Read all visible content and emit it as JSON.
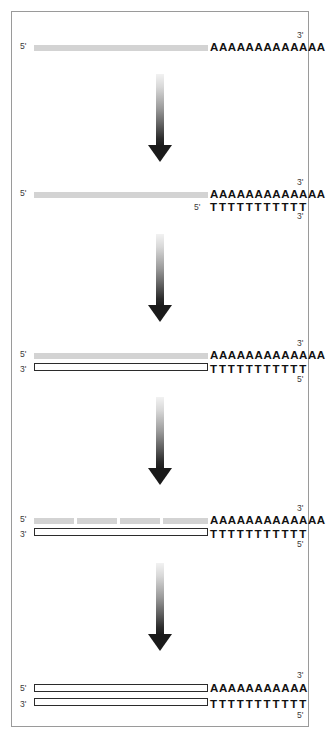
{
  "figure": {
    "frame": {
      "border_color": "#9a9a9a",
      "background": "#ffffff"
    },
    "colors": {
      "rna_strand": "#d3d3d3",
      "cdna_strand_fill": "#ffffff",
      "cdna_strand_outline": "#2b2b2b",
      "base_text": "#111111",
      "end_label": "#3a3a3a",
      "arrow_dark": "#1a1a1a",
      "arrow_light": "#f2f2f2"
    },
    "arrow_label": "downward-gradient-arrow"
  },
  "panels": [
    {
      "id": "panel-1-mrna-template",
      "name": "mrna-template",
      "strands": [
        {
          "id": "p1-rna",
          "type": "rna",
          "left_label": "5'",
          "right_label": "3'",
          "bases": "AAAAAAAAAAAAA",
          "base_count": 13,
          "fragments": 1
        }
      ]
    },
    {
      "id": "panel-2-oligo-dt-primer-annealing",
      "name": "oligo-dt-primer-annealing",
      "strands": [
        {
          "id": "p2-rna",
          "type": "rna",
          "left_label": "5'",
          "right_label": "3'",
          "bases": "AAAAAAAAAAAAA",
          "base_count": 13,
          "fragments": 1
        },
        {
          "id": "p2-primer",
          "type": "primer",
          "left_label": "5'",
          "right_label": "3'",
          "bases": "TTTTTTTTTTT",
          "base_count": 11,
          "fragments": 0
        }
      ]
    },
    {
      "id": "panel-3-first-strand-synthesis",
      "name": "first-strand-cdna-synthesis",
      "strands": [
        {
          "id": "p3-rna",
          "type": "rna",
          "left_label": "5'",
          "right_label": "3'",
          "bases": "AAAAAAAAAAAAA",
          "base_count": 13,
          "fragments": 1
        },
        {
          "id": "p3-cdna",
          "type": "cdna",
          "left_label": "3'",
          "right_label": "5'",
          "bases": "TTTTTTTTTTT",
          "base_count": 11,
          "fragments": 1
        }
      ]
    },
    {
      "id": "panel-4-rna-nicking",
      "name": "rna-template-nicking",
      "strands": [
        {
          "id": "p4-rna",
          "type": "rna",
          "left_label": "5'",
          "right_label": "3'",
          "bases": "AAAAAAAAAAAAA",
          "base_count": 13,
          "fragments": 4
        },
        {
          "id": "p4-cdna",
          "type": "cdna",
          "left_label": "3'",
          "right_label": "5'",
          "bases": "TTTTTTTTTTT",
          "base_count": 11,
          "fragments": 1
        }
      ]
    },
    {
      "id": "panel-5-double-stranded-cdna",
      "name": "double-stranded-cdna",
      "strands": [
        {
          "id": "p5-cdna-top",
          "type": "cdna",
          "left_label": "5'",
          "right_label": "3'",
          "bases": "AAAAAAAAAAA",
          "base_count": 11,
          "fragments": 1
        },
        {
          "id": "p5-cdna-bottom",
          "type": "cdna",
          "left_label": "3'",
          "right_label": "5'",
          "bases": "TTTTTTTTTTT",
          "base_count": 11,
          "fragments": 1
        }
      ]
    }
  ]
}
